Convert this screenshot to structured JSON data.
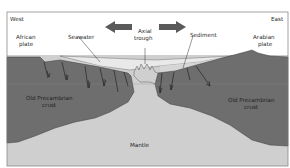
{
  "diagram": {
    "directions": {
      "west": "West",
      "east": "East"
    },
    "labels": {
      "african_plate_line1": "African",
      "african_plate_line2": "plate",
      "seawater": "Seawater",
      "axial_trough_line1": "Axial",
      "axial_trough_line2": "trough",
      "sediment": "Sediment",
      "arabian_plate_line1": "Arabian",
      "arabian_plate_line2": "plate",
      "left_crust_line1": "Old Precambrian",
      "left_crust_line2": "crust",
      "right_crust_line1": "Old Precambrian",
      "right_crust_line2": "crust",
      "mantle": "Mantle"
    },
    "arrows": [
      {
        "direction": "left",
        "meaning": "plate divergence west"
      },
      {
        "direction": "right",
        "meaning": "plate divergence east"
      }
    ],
    "colors": {
      "sky": "#ffffff",
      "crust": "#6e6e6e",
      "seawater": "#e6e6e6",
      "sediment": "#d2d2d2",
      "mantle": "#cfcfcf",
      "arrow": "#5a5a5a",
      "frame": "#8a8a8a"
    }
  }
}
